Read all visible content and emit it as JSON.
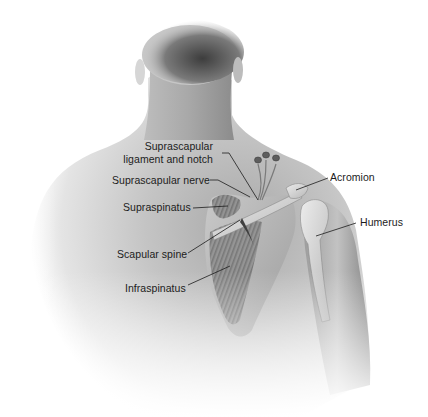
{
  "figure": {
    "colors": {
      "background": "#ffffff",
      "skin_light": "#e8e8e8",
      "skin_mid": "#b9b9b9",
      "skin_dark": "#6e6e6e",
      "hair": "#4a4a4a",
      "bone": "#d6d6d6",
      "muscle": "#8f8f8f",
      "leader_line": "#1c1c1c",
      "label_text": "#1c1c1c"
    }
  },
  "labels": [
    {
      "id": "suprascapular-ligament-notch",
      "lines": [
        "Suprascapular",
        "ligament and notch"
      ]
    },
    {
      "id": "suprascapular-nerve",
      "text": "Suprascapular nerve"
    },
    {
      "id": "supraspinatus",
      "text": "Supraspinatus"
    },
    {
      "id": "scapular-spine",
      "text": "Scapular spine"
    },
    {
      "id": "infraspinatus",
      "text": "Infraspinatus"
    },
    {
      "id": "acromion",
      "text": "Acromion"
    },
    {
      "id": "humerus",
      "text": "Humerus"
    }
  ]
}
